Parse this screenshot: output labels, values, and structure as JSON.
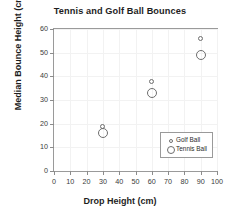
{
  "chart_data": {
    "type": "scatter",
    "title": "Tennis and Golf Ball Bounces",
    "xlabel": "Drop Height (cm)",
    "ylabel": "Median Bounce Height (cm)",
    "xlim": [
      0,
      100
    ],
    "ylim": [
      0,
      60
    ],
    "xticks": [
      0,
      10,
      20,
      30,
      40,
      50,
      60,
      70,
      80,
      90,
      100
    ],
    "yticks": [
      0,
      10,
      20,
      30,
      40,
      50,
      60
    ],
    "xtick_labels": [
      "0",
      "10",
      "20",
      "30",
      "40",
      "50",
      "60",
      "70",
      "80",
      "90",
      "100"
    ],
    "ytick_labels": [
      "0",
      "10",
      "20",
      "30",
      "40",
      "50",
      "60"
    ],
    "grid": true,
    "legend_position": "lower right",
    "x": [
      30,
      60,
      90
    ],
    "series": [
      {
        "name": "Golf Ball",
        "marker": "open-circle-small",
        "color": "#6e6e6e",
        "values": [
          19,
          38,
          56
        ]
      },
      {
        "name": "Tennis Ball",
        "marker": "open-circle-large",
        "color": "#6e6e6e",
        "values": [
          16,
          33,
          49
        ]
      }
    ]
  }
}
